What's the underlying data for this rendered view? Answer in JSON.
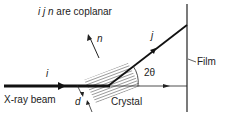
{
  "diagram": {
    "title_vectors": "i j n",
    "title_rest": " are coplanar",
    "labels": {
      "normal": "n",
      "diffracted": "j",
      "incident": "i",
      "angle": "2θ",
      "film": "Film",
      "beam": "X-ray beam",
      "crystal": "Crystal",
      "spacing": "d"
    },
    "colors": {
      "line": "#222222",
      "hatch": "#555555",
      "background": "#ffffff"
    }
  }
}
